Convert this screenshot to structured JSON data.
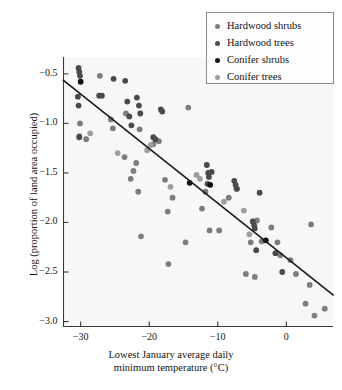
{
  "chart_data": {
    "type": "scatter",
    "title": "",
    "xlabel": "Lowest January average daily minimum temperature (°C)",
    "xlabel_line1": "Lowest January average daily",
    "xlabel_line2": "minimum temperature (°C)",
    "ylabel": "Log (proportion of land area occupied)",
    "xlim": [
      -32.5,
      6.8
    ],
    "ylim": [
      -3.05,
      -0.33
    ],
    "xticks": [
      -30,
      -20,
      -10,
      0
    ],
    "xtick_labels": [
      "−30",
      "−20",
      "−10",
      "0"
    ],
    "yticks": [
      -0.5,
      -1.0,
      -1.5,
      -2.0,
      -2.5,
      -3.0
    ],
    "ytick_labels": [
      "−0.5",
      "−1.0",
      "−1.5",
      "−2.0",
      "−2.5",
      "−3.0"
    ],
    "grid": false,
    "legend_position": "top-right",
    "colors": {
      "hardwood_shrubs": "#7d7d7d",
      "hardwood_trees": "#4a4a4a",
      "conifer_shrubs": "#111111",
      "conifer_trees": "#9e9e9e",
      "regression_line": "#1a1a1a",
      "axis": "#3a3a3a",
      "plot_background": "#f7f7f7"
    },
    "trendline": {
      "type": "linear",
      "x_start": -32.5,
      "y_start": -0.565,
      "x_end": 6.8,
      "y_end": -2.73,
      "slope": -0.0551,
      "intercept": -2.358
    },
    "series": [
      {
        "name": "Hardwood shrubs",
        "color": "#7d7d7d",
        "points": [
          [
            -30.1,
            -1.0
          ],
          [
            -29.2,
            -1.16
          ],
          [
            -30.2,
            -1.13
          ],
          [
            -27.2,
            -0.52
          ],
          [
            -25.6,
            -0.96
          ],
          [
            -25.3,
            -1.05
          ],
          [
            -23.4,
            -0.9
          ],
          [
            -23.6,
            -1.34
          ],
          [
            -22.7,
            -1.56
          ],
          [
            -22.3,
            -1.48
          ],
          [
            -21.9,
            -1.4
          ],
          [
            -21.6,
            -1.69
          ],
          [
            -21.4,
            -1.06
          ],
          [
            -21.2,
            -2.14
          ],
          [
            -19.4,
            -1.21
          ],
          [
            -18.6,
            -1.18
          ],
          [
            -17.7,
            -1.57
          ],
          [
            -17.3,
            -1.89
          ],
          [
            -17.2,
            -2.42
          ],
          [
            -16.6,
            -1.75
          ],
          [
            -14.3,
            -0.84
          ],
          [
            -14.7,
            -2.2
          ],
          [
            -12.3,
            -1.86
          ],
          [
            -11.8,
            -1.69
          ],
          [
            -11.2,
            -2.08
          ],
          [
            -9.8,
            -2.08
          ],
          [
            -8.4,
            -1.75
          ],
          [
            -7.3,
            -1.66
          ],
          [
            -5.9,
            -2.52
          ],
          [
            -5.2,
            -2.2
          ],
          [
            -4.6,
            -2.55
          ],
          [
            -4.3,
            -1.98
          ],
          [
            -3.6,
            -2.19
          ],
          [
            -2.2,
            -2.05
          ],
          [
            -1.3,
            -2.2
          ],
          [
            -0.9,
            -2.33
          ],
          [
            0.6,
            -2.38
          ],
          [
            1.4,
            -2.52
          ],
          [
            2.8,
            -2.82
          ],
          [
            3.6,
            -2.02
          ],
          [
            4.1,
            -2.94
          ],
          [
            5.6,
            -2.87
          ],
          [
            3.4,
            -2.63
          ]
        ]
      },
      {
        "name": "Hardwood trees",
        "color": "#4a4a4a",
        "points": [
          [
            -30.3,
            -0.44
          ],
          [
            -30.2,
            -0.48
          ],
          [
            -30.1,
            -0.52
          ],
          [
            -30.4,
            -0.73
          ],
          [
            -30.3,
            -0.82
          ],
          [
            -30.2,
            -1.14
          ],
          [
            -27.3,
            -0.72
          ],
          [
            -26.9,
            -0.72
          ],
          [
            -25.2,
            -0.55
          ],
          [
            -23.5,
            -0.57
          ],
          [
            -23.2,
            -0.78
          ],
          [
            -22.9,
            -0.93
          ],
          [
            -22.6,
            -1.02
          ],
          [
            -21.8,
            -0.74
          ],
          [
            -21.5,
            -0.82
          ],
          [
            -21.3,
            -0.9
          ],
          [
            -19.4,
            -1.14
          ],
          [
            -19.1,
            -1.16
          ],
          [
            -18.3,
            -0.86
          ],
          [
            -18.1,
            -0.88
          ],
          [
            -11.6,
            -1.42
          ],
          [
            -11.4,
            -1.5
          ],
          [
            -11.3,
            -1.54
          ],
          [
            -11.5,
            -1.61
          ],
          [
            -10.9,
            -1.49
          ],
          [
            -7.6,
            -1.58
          ],
          [
            -7.4,
            -1.62
          ],
          [
            -7.2,
            -1.66
          ],
          [
            -4.9,
            -1.99
          ],
          [
            -4.7,
            -2.03
          ],
          [
            -4.6,
            -2.06
          ],
          [
            -4.4,
            -2.28
          ],
          [
            -3.9,
            -1.7
          ],
          [
            -1.6,
            -2.31
          ],
          [
            -0.6,
            -2.5
          ]
        ]
      },
      {
        "name": "Conifer shrubs",
        "color": "#111111",
        "points": [
          [
            -30.0,
            -0.58
          ],
          [
            -14.1,
            -1.6
          ],
          [
            -11.1,
            -1.62
          ],
          [
            -3.0,
            -2.18
          ]
        ]
      },
      {
        "name": "Conifer trees",
        "color": "#9e9e9e",
        "points": [
          [
            -28.6,
            -1.1
          ],
          [
            -24.6,
            -1.3
          ],
          [
            -20.3,
            -1.27
          ],
          [
            -19.8,
            -1.22
          ],
          [
            -16.9,
            -1.64
          ],
          [
            -13.1,
            -1.52
          ],
          [
            -12.6,
            -1.56
          ],
          [
            -9.1,
            -1.79
          ],
          [
            -6.2,
            -1.88
          ],
          [
            -5.4,
            -2.12
          ]
        ]
      }
    ]
  },
  "legend": {
    "items": [
      {
        "label": "Hardwood shrubs",
        "color": "#7d7d7d"
      },
      {
        "label": "Hardwood trees",
        "color": "#4a4a4a"
      },
      {
        "label": "Conifer shrubs",
        "color": "#111111"
      },
      {
        "label": "Conifer trees",
        "color": "#9e9e9e"
      }
    ]
  }
}
